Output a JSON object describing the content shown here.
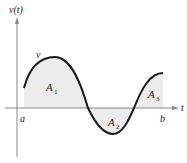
{
  "diagram": {
    "y_axis_label": "v(t)",
    "x_axis_label": "t",
    "curve_label": "v",
    "left_bound_label": "a",
    "right_bound_label": "b",
    "regions": [
      {
        "name": "A",
        "sub": "1",
        "sign": "positive"
      },
      {
        "name": "A",
        "sub": "2",
        "sign": "negative"
      },
      {
        "name": "A",
        "sub": "3",
        "sign": "positive"
      }
    ],
    "colors": {
      "curve": "#1a1a1a",
      "axis": "#888888",
      "fill": "#ececec",
      "text": "#222222"
    }
  }
}
